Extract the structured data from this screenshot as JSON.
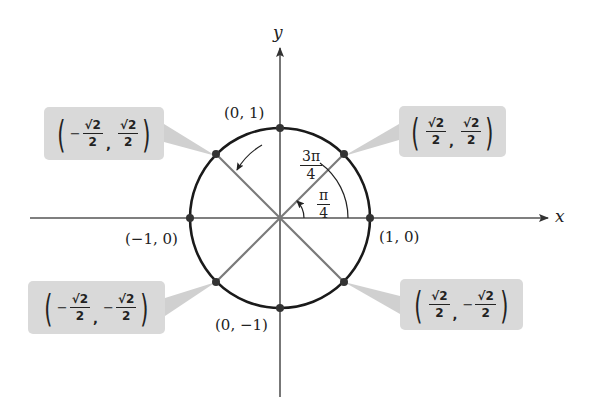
{
  "diagram": {
    "type": "unit-circle",
    "axes": {
      "x_label": "x",
      "y_label": "y"
    },
    "angles": [
      {
        "name": "pi-over-4",
        "num": "π",
        "den": "4"
      },
      {
        "name": "three-pi-over-4",
        "num": "3π",
        "den": "4"
      }
    ],
    "axis_points": [
      {
        "name": "point-0-1",
        "label": "(0, 1)"
      },
      {
        "name": "point-neg1-0",
        "label": "(−1, 0)"
      },
      {
        "name": "point-1-0",
        "label": "(1, 0)"
      },
      {
        "name": "point-0-neg1",
        "label": "(0, −1)"
      }
    ],
    "diagonal_points": [
      {
        "name": "point-q2",
        "x_sign": "−",
        "x_num": "√2",
        "x_den": "2",
        "y_sign": "",
        "y_num": "√2",
        "y_den": "2"
      },
      {
        "name": "point-q1",
        "x_sign": "",
        "x_num": "√2",
        "x_den": "2",
        "y_sign": "",
        "y_num": "√2",
        "y_den": "2"
      },
      {
        "name": "point-q3",
        "x_sign": "−",
        "x_num": "√2",
        "x_den": "2",
        "y_sign": "−",
        "y_num": "√2",
        "y_den": "2"
      },
      {
        "name": "point-q4",
        "x_sign": "",
        "x_num": "√2",
        "x_den": "2",
        "y_sign": "−",
        "y_num": "√2",
        "y_den": "2"
      }
    ],
    "colors": {
      "circle": "#1a1a1a",
      "axes": "#555555",
      "radii": "#777777",
      "label_box": "#d9d9d9",
      "callout": "#cfcfcf",
      "point": "#333333"
    }
  }
}
